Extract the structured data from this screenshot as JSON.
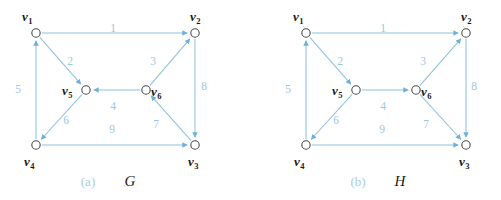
{
  "figure": {
    "width": 501,
    "height": 200,
    "background": "#ffffff",
    "edge_color": "#8ec2e0",
    "label_color": "#9ec6e0",
    "vertex_color": "#1a1a1a",
    "caption_index_color": "#a8cbe2"
  },
  "panels": [
    {
      "id": "panel-a",
      "caption_index": "(a)",
      "caption_name": "G",
      "vertices": [
        {
          "id": "v1",
          "base": "v",
          "sub": "1",
          "label": "v1",
          "x": 36,
          "y": 33,
          "label_x": 22,
          "label_y": 21,
          "label_anchor": "start"
        },
        {
          "id": "v2",
          "base": "v",
          "sub": "2",
          "label": "v2",
          "x": 195,
          "y": 33,
          "label_x": 190,
          "label_y": 21,
          "label_anchor": "start"
        },
        {
          "id": "v3",
          "base": "v",
          "sub": "3",
          "label": "v3",
          "x": 195,
          "y": 145,
          "label_x": 188,
          "label_y": 166,
          "label_anchor": "start"
        },
        {
          "id": "v4",
          "base": "v",
          "sub": "4",
          "label": "v4",
          "x": 36,
          "y": 145,
          "label_x": 24,
          "label_y": 166,
          "label_anchor": "start"
        },
        {
          "id": "v5",
          "base": "v",
          "sub": "5",
          "label": "v5",
          "x": 86,
          "y": 90,
          "label_x": 62,
          "label_y": 95,
          "label_anchor": "start"
        },
        {
          "id": "v6",
          "base": "v",
          "sub": "6",
          "label": "v6",
          "x": 146,
          "y": 90,
          "label_x": 151,
          "label_y": 96,
          "label_anchor": "start"
        }
      ],
      "edges": [
        {
          "id": "e1",
          "label": "1",
          "from": "v1",
          "to": "v2",
          "label_x": 113,
          "label_y": 32
        },
        {
          "id": "e2",
          "label": "2",
          "from": "v1",
          "to": "v5",
          "label_x": 70,
          "label_y": 65
        },
        {
          "id": "e3",
          "label": "3",
          "from": "v6",
          "to": "v2",
          "label_x": 153,
          "label_y": 65
        },
        {
          "id": "e4",
          "label": "4",
          "from": "v6",
          "to": "v5",
          "label_x": 113,
          "label_y": 110
        },
        {
          "id": "e5",
          "label": "5",
          "from": "v4",
          "to": "v1",
          "label_x": 18,
          "label_y": 93
        },
        {
          "id": "e6",
          "label": "6",
          "from": "v5",
          "to": "v4",
          "label_x": 66,
          "label_y": 124
        },
        {
          "id": "e7",
          "label": "7",
          "from": "v3",
          "to": "v6",
          "label_x": 156,
          "label_y": 128
        },
        {
          "id": "e8",
          "label": "8",
          "from": "v2",
          "to": "v3",
          "label_x": 204,
          "label_y": 90
        },
        {
          "id": "e9",
          "label": "9",
          "from": "v4",
          "to": "v3",
          "label_x": 112,
          "label_y": 133
        }
      ],
      "caption_index_x": 88,
      "caption_name_x": 130,
      "caption_y": 186
    },
    {
      "id": "panel-b",
      "caption_index": "(b)",
      "caption_name": "H",
      "vertices": [
        {
          "id": "v1",
          "base": "v",
          "sub": "1",
          "label": "v1",
          "x": 306,
          "y": 33,
          "label_x": 293,
          "label_y": 21,
          "label_anchor": "start"
        },
        {
          "id": "v2",
          "base": "v",
          "sub": "2",
          "label": "v2",
          "x": 466,
          "y": 33,
          "label_x": 461,
          "label_y": 21,
          "label_anchor": "start"
        },
        {
          "id": "v3",
          "base": "v",
          "sub": "3",
          "label": "v3",
          "x": 466,
          "y": 145,
          "label_x": 459,
          "label_y": 166,
          "label_anchor": "start"
        },
        {
          "id": "v4",
          "base": "v",
          "sub": "4",
          "label": "v4",
          "x": 306,
          "y": 145,
          "label_x": 294,
          "label_y": 166,
          "label_anchor": "start"
        },
        {
          "id": "v5",
          "base": "v",
          "sub": "5",
          "label": "v5",
          "x": 356,
          "y": 90,
          "label_x": 332,
          "label_y": 95,
          "label_anchor": "start"
        },
        {
          "id": "v6",
          "base": "v",
          "sub": "6",
          "label": "v6",
          "x": 416,
          "y": 90,
          "label_x": 421,
          "label_y": 96,
          "label_anchor": "start"
        }
      ],
      "edges": [
        {
          "id": "e1",
          "label": "1",
          "from": "v1",
          "to": "v2",
          "label_x": 383,
          "label_y": 32
        },
        {
          "id": "e2",
          "label": "2",
          "from": "v1",
          "to": "v5",
          "label_x": 340,
          "label_y": 65
        },
        {
          "id": "e3",
          "label": "3",
          "from": "v6",
          "to": "v2",
          "label_x": 423,
          "label_y": 65
        },
        {
          "id": "e4",
          "label": "4",
          "from": "v5",
          "to": "v6",
          "label_x": 383,
          "label_y": 110
        },
        {
          "id": "e5",
          "label": "5",
          "from": "v4",
          "to": "v1",
          "label_x": 288,
          "label_y": 93
        },
        {
          "id": "e6",
          "label": "6",
          "from": "v5",
          "to": "v4",
          "label_x": 336,
          "label_y": 124
        },
        {
          "id": "e7",
          "label": "7",
          "from": "v6",
          "to": "v3",
          "label_x": 426,
          "label_y": 128
        },
        {
          "id": "e8",
          "label": "8",
          "from": "v2",
          "to": "v3",
          "label_x": 474,
          "label_y": 90
        },
        {
          "id": "e9",
          "label": "9",
          "from": "v4",
          "to": "v3",
          "label_x": 382,
          "label_y": 133
        }
      ],
      "caption_index_x": 358,
      "caption_name_x": 400,
      "caption_y": 186
    }
  ]
}
